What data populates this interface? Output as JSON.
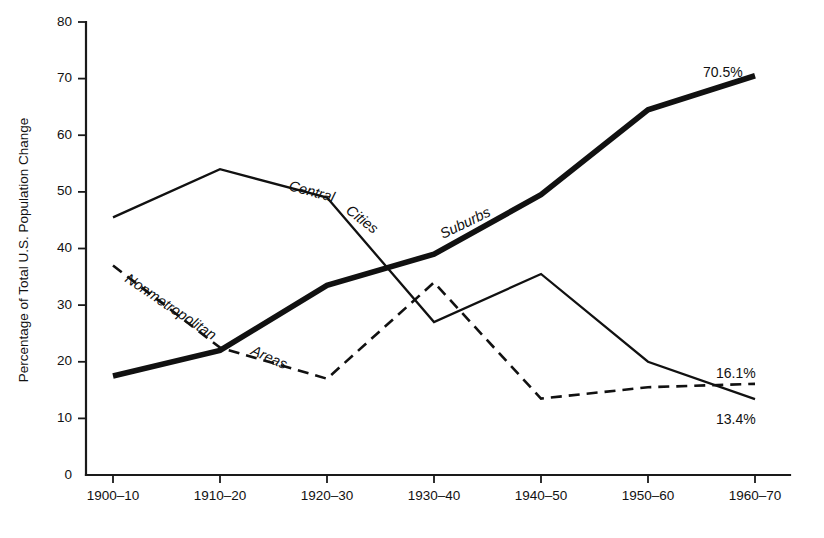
{
  "chart_data": {
    "type": "line",
    "title": "",
    "xlabel": "",
    "ylabel": "Percentage of Total U.S. Population Change",
    "categories": [
      "1900–10",
      "1910–20",
      "1920–30",
      "1930–40",
      "1940–50",
      "1950–60",
      "1960–70"
    ],
    "ylim": [
      0,
      80
    ],
    "yticks": [
      0,
      10,
      20,
      30,
      40,
      50,
      60,
      70,
      80
    ],
    "grid": false,
    "legend_position": "inline-labels",
    "series": [
      {
        "name": "Central Cities",
        "style": "solid-thin",
        "values": [
          45.5,
          54.0,
          49.0,
          27.0,
          35.5,
          20.0,
          13.4
        ],
        "end_label": "13.4%"
      },
      {
        "name": "Suburbs",
        "style": "solid-thick",
        "values": [
          17.5,
          22.0,
          33.5,
          39.0,
          49.5,
          64.5,
          70.5
        ],
        "end_label": "70.5%"
      },
      {
        "name": "Nonmetropolitan Areas",
        "style": "dashed",
        "values": [
          37.0,
          22.5,
          17.0,
          34.0,
          13.5,
          15.5,
          16.1
        ],
        "end_label": "16.1%"
      }
    ],
    "annotations": [
      {
        "text": "Central",
        "series": "Central Cities"
      },
      {
        "text": "Cities",
        "series": "Central Cities"
      },
      {
        "text": "Suburbs",
        "series": "Suburbs"
      },
      {
        "text": "Nonmetropolitan",
        "series": "Nonmetropolitan Areas"
      },
      {
        "text": "Areas",
        "series": "Nonmetropolitan Areas"
      }
    ]
  },
  "axes": {
    "y": {
      "title": "Percentage of Total U.S. Population Change",
      "labels": [
        "80",
        "70",
        "60",
        "50",
        "40",
        "30",
        "20",
        "10",
        "0"
      ]
    },
    "x": {
      "labels": [
        "1900–10",
        "1910–20",
        "1920–30",
        "1930–40",
        "1940–50",
        "1950–60",
        "1960–70"
      ]
    }
  },
  "series_labels": {
    "central": "Central",
    "cities": "Cities",
    "suburbs": "Suburbs",
    "nonmetropolitan": "Nonmetropolitan",
    "areas": "Areas"
  },
  "endpoint_labels": {
    "suburbs": "70.5%",
    "nonmetropolitan": "16.1%",
    "central_cities": "13.4%"
  }
}
